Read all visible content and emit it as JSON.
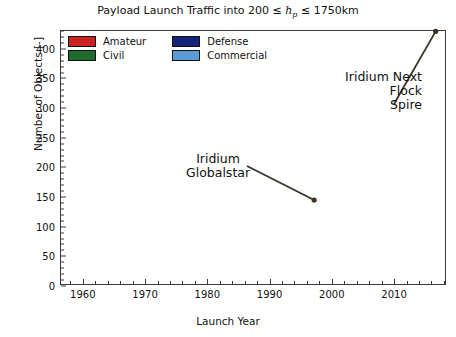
{
  "chart_data": {
    "type": "bar",
    "title_pre": "Payload Launch Traffic into 200",
    "title_le1": "≤",
    "title_hp": "h",
    "title_hp_sub": "p",
    "title_le2": "≤",
    "title_post": "1750km",
    "xlabel": "Launch Year",
    "ylabel": "Number of Objects [-]",
    "stacked": true,
    "grid": false,
    "legend_position": "upper-left-inside",
    "xlim": [
      1956.5,
      2018.5
    ],
    "ylim": [
      0,
      430
    ],
    "xticks": [
      1960,
      1970,
      1980,
      1990,
      2000,
      2010
    ],
    "yticks": [
      0,
      50,
      100,
      150,
      200,
      250,
      300,
      350,
      400
    ],
    "colors": {
      "amateur": "#cc2222",
      "civil": "#1f6b2f",
      "defense": "#14247a",
      "commercial": "#5b9bd5",
      "edge": "#1a1a1a",
      "axis": "#3a3a3a",
      "text": "#111111"
    },
    "legend": [
      {
        "label": "Amateur",
        "color": "#cc2222",
        "key": "amateur"
      },
      {
        "label": "Defense",
        "color": "#14247a",
        "key": "defense"
      },
      {
        "label": "Civil",
        "color": "#1f6b2f",
        "key": "civil"
      },
      {
        "label": "Commercial",
        "color": "#5b9bd5",
        "key": "commercial"
      }
    ],
    "series": [
      {
        "name": "Amateur",
        "key": "amateur",
        "color": "#cc2222"
      },
      {
        "name": "Civil",
        "key": "civil",
        "color": "#1f6b2f"
      },
      {
        "name": "Defense",
        "key": "defense",
        "color": "#14247a"
      },
      {
        "name": "Commercial",
        "key": "commercial",
        "color": "#5b9bd5"
      }
    ],
    "x": [
      1957,
      1958,
      1959,
      1960,
      1961,
      1962,
      1963,
      1964,
      1965,
      1966,
      1967,
      1968,
      1969,
      1970,
      1971,
      1972,
      1973,
      1974,
      1975,
      1976,
      1977,
      1978,
      1979,
      1980,
      1981,
      1982,
      1983,
      1984,
      1985,
      1986,
      1987,
      1988,
      1989,
      1990,
      1991,
      1992,
      1993,
      1994,
      1995,
      1996,
      1997,
      1998,
      1999,
      2000,
      2001,
      2002,
      2003,
      2004,
      2005,
      2006,
      2007,
      2008,
      2009,
      2010,
      2011,
      2012,
      2013,
      2014,
      2015,
      2016,
      2017,
      2018
    ],
    "values": {
      "amateur": [
        0,
        0,
        0,
        0,
        0,
        0,
        1,
        0,
        1,
        0,
        1,
        0,
        0,
        1,
        1,
        0,
        0,
        1,
        1,
        1,
        0,
        1,
        0,
        1,
        2,
        1,
        1,
        0,
        1,
        1,
        1,
        1,
        2,
        2,
        1,
        1,
        1,
        2,
        2,
        2,
        3,
        3,
        3,
        4,
        2,
        2,
        2,
        2,
        3,
        3,
        4,
        3,
        5,
        6,
        5,
        9,
        27,
        36,
        22,
        34,
        68,
        58
      ],
      "civil": [
        1,
        3,
        6,
        8,
        12,
        16,
        20,
        22,
        26,
        30,
        28,
        26,
        27,
        25,
        26,
        24,
        22,
        25,
        28,
        32,
        30,
        32,
        30,
        35,
        34,
        36,
        35,
        34,
        33,
        30,
        30,
        28,
        26,
        30,
        34,
        36,
        34,
        36,
        35,
        34,
        34,
        33,
        30,
        28,
        24,
        20,
        18,
        22,
        26,
        30,
        34,
        36,
        40,
        44,
        48,
        52,
        62,
        70,
        60,
        66,
        72,
        64
      ],
      "defense": [
        1,
        5,
        14,
        28,
        38,
        52,
        46,
        58,
        72,
        78,
        72,
        66,
        60,
        58,
        62,
        70,
        66,
        72,
        76,
        84,
        78,
        82,
        74,
        80,
        78,
        76,
        72,
        68,
        70,
        62,
        58,
        56,
        52,
        44,
        40,
        36,
        28,
        24,
        22,
        20,
        18,
        16,
        14,
        12,
        10,
        10,
        8,
        10,
        12,
        14,
        16,
        18,
        20,
        22,
        26,
        30,
        36,
        42,
        38,
        46,
        52,
        48
      ],
      "commercial": [
        0,
        0,
        0,
        0,
        1,
        1,
        2,
        2,
        2,
        2,
        3,
        3,
        3,
        4,
        4,
        4,
        4,
        5,
        5,
        6,
        6,
        8,
        8,
        10,
        10,
        12,
        12,
        14,
        14,
        12,
        12,
        12,
        12,
        14,
        16,
        18,
        20,
        26,
        34,
        44,
        82,
        90,
        46,
        40,
        22,
        16,
        12,
        10,
        10,
        12,
        16,
        22,
        26,
        34,
        44,
        52,
        72,
        84,
        104,
        166,
        240,
        218
      ]
    },
    "totals_note": [
      2,
      8,
      20,
      36,
      51,
      69,
      69,
      82,
      101,
      110,
      104,
      95,
      90,
      88,
      93,
      98,
      92,
      103,
      110,
      123,
      114,
      123,
      112,
      126,
      124,
      125,
      120,
      116,
      118,
      105,
      101,
      97,
      92,
      90,
      91,
      91,
      83,
      88,
      93,
      100,
      137,
      142,
      93,
      84,
      58,
      48,
      40,
      44,
      45,
      59,
      70,
      79,
      91,
      106,
      127,
      149,
      203,
      232,
      224,
      304,
      426,
      388
    ],
    "annotations": [
      {
        "text_lines": [
          "Iridium",
          "Globalstar"
        ],
        "target_x": 1997,
        "target_y": 140
      },
      {
        "text_lines": [
          "Iridium Next",
          "Flock",
          "Spire"
        ],
        "target_x": 2017,
        "target_y": 426
      }
    ]
  }
}
